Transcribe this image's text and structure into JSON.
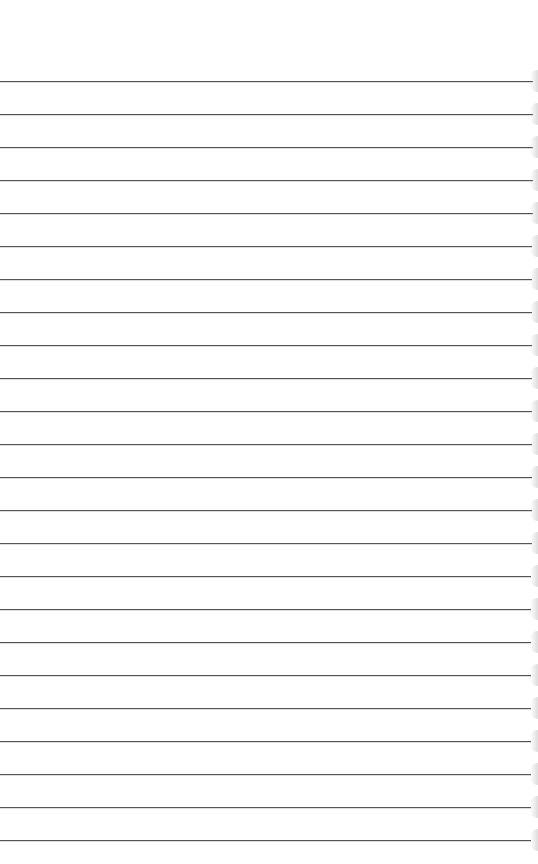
{
  "page": {
    "type": "lined-paper",
    "background": "#ffffff",
    "line_color": "#555555",
    "first_line_y": 81,
    "line_spacing": 33,
    "line_count": 24,
    "line_start_x": 0,
    "line_end_x": 533
  }
}
